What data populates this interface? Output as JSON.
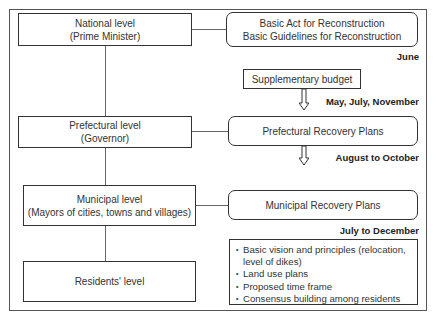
{
  "levels": [
    {
      "title": "National level",
      "subtitle": "(Prime Minister)"
    },
    {
      "title": "Prefectural level",
      "subtitle": "(Governor)"
    },
    {
      "title": "Municipal level",
      "subtitle": "(Mayors of cities, towns and villages)"
    },
    {
      "title": "Residents' level",
      "subtitle": ""
    }
  ],
  "plans": {
    "basic_act_line1": "Basic Act for Reconstruction",
    "basic_act_line2": "Basic Guidelines for Reconstruction",
    "supplementary_budget": "Supplementary budget",
    "prefectural_plans": "Prefectural Recovery Plans",
    "municipal_plans": "Municipal Recovery Plans"
  },
  "dates": {
    "june": "June",
    "budget": "May, July, November",
    "prefectural": "August to October",
    "municipal": "July to December"
  },
  "municipal_contents": [
    "Basic vision and principles (relocation, level of dikes)",
    "Land use plans",
    "Proposed time frame",
    "Consensus building among residents"
  ]
}
